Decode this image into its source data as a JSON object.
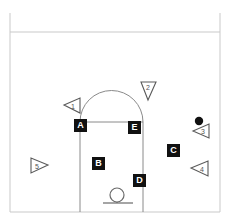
{
  "diagram": {
    "width": 229,
    "height": 224,
    "background_color": "#ffffff",
    "line_color": "#c9c9c9",
    "key_line_color": "#8a8a8a",
    "marker_fill": "#111111",
    "marker_text_color": "#ffffff",
    "player_outline_color": "#555555",
    "ball_color": "#111111"
  },
  "court": {
    "name": "half-court",
    "boundary": {
      "left": 10,
      "top": 13,
      "right": 220,
      "bottom": 212
    },
    "baseline_y": 32,
    "key": {
      "left": 80,
      "right": 143,
      "top": 122,
      "bottom": 212
    },
    "free_throw_line_y": 122,
    "free_throw_arc_radius": 31,
    "hoop": {
      "cx": 117,
      "cy": 196,
      "r": 7
    },
    "backboard": {
      "y": 204,
      "left": 103,
      "right": 133
    }
  },
  "position_labels": [
    {
      "id": "A",
      "text": "A",
      "x": 74,
      "y": 119
    },
    {
      "id": "B",
      "text": "B",
      "x": 92,
      "y": 157
    },
    {
      "id": "C",
      "text": "C",
      "x": 167,
      "y": 144
    },
    {
      "id": "D",
      "text": "D",
      "x": 133,
      "y": 174
    },
    {
      "id": "E",
      "text": "E",
      "x": 128,
      "y": 121
    }
  ],
  "players": [
    {
      "id": "1",
      "number": "1",
      "x": 73,
      "y": 104,
      "direction": "left",
      "label": "player-1"
    },
    {
      "id": "2",
      "number": "2",
      "x": 148,
      "y": 90,
      "direction": "down",
      "label": "player-2"
    },
    {
      "id": "3",
      "number": "3",
      "x": 203,
      "y": 131,
      "direction": "left",
      "label": "player-3"
    },
    {
      "id": "4",
      "number": "4",
      "x": 202,
      "y": 168,
      "direction": "left",
      "label": "player-4"
    },
    {
      "id": "5",
      "number": "5",
      "x": 38,
      "y": 165,
      "direction": "right",
      "label": "player-5"
    }
  ],
  "ball": {
    "x": 199,
    "y": 121,
    "r": 4,
    "label": "basketball"
  }
}
